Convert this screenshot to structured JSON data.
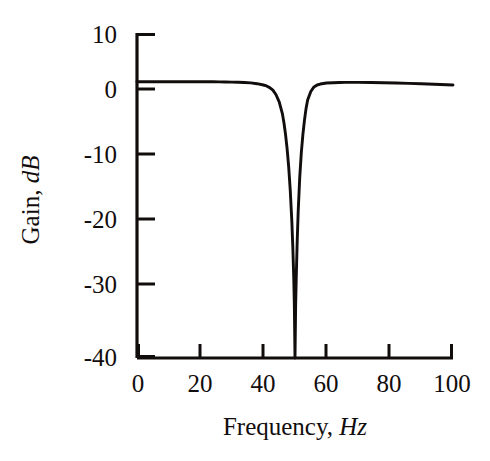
{
  "chart_data": {
    "type": "line",
    "title": "",
    "xlabel": "Frequency,",
    "xlabel_unit": "Hz",
    "ylabel": "Gain,",
    "ylabel_unit": "dB",
    "xlim": [
      0,
      100
    ],
    "ylim": [
      -40,
      10
    ],
    "xticks": [
      0,
      20,
      40,
      60,
      80,
      100
    ],
    "xtick_labels": [
      "0",
      "20",
      "40",
      "60",
      "80",
      "100"
    ],
    "yticks": [
      10,
      0,
      -10,
      -20,
      -30,
      -40
    ],
    "ytick_labels": [
      "10",
      "0",
      "-10",
      "-20",
      "-30",
      "-40"
    ],
    "grid": false,
    "legend": "none",
    "tick_direction": "in",
    "axes_style": "left-bottom-spines",
    "series": [
      {
        "name": "Notch filter gain response",
        "notch_center_hz": 50,
        "notch_depth_db": -40,
        "passband_gain_db": 2.5,
        "x": [
          0,
          2,
          4,
          6,
          8,
          10,
          12,
          14,
          16,
          18,
          20,
          22,
          24,
          26,
          28,
          30,
          32,
          34,
          36,
          38,
          40,
          41,
          42,
          43,
          44,
          45,
          46,
          46.5,
          47,
          47.5,
          48,
          48.5,
          49,
          49.3,
          49.6,
          49.8,
          50,
          50.2,
          50.4,
          50.7,
          51,
          51.5,
          52,
          52.5,
          53,
          53.5,
          54,
          55,
          56,
          57,
          58,
          60,
          62,
          64,
          66,
          68,
          70,
          74,
          78,
          82,
          86,
          90,
          94,
          98,
          100
        ],
        "y": [
          2.5,
          2.5,
          2.5,
          2.5,
          2.5,
          2.5,
          2.5,
          2.5,
          2.5,
          2.5,
          2.5,
          2.5,
          2.5,
          2.48,
          2.46,
          2.44,
          2.42,
          2.38,
          2.32,
          2.2,
          2.0,
          1.85,
          1.6,
          1.2,
          0.5,
          -0.6,
          -2.4,
          -3.8,
          -5.6,
          -7.8,
          -10.6,
          -14.2,
          -19.0,
          -22.8,
          -27.6,
          -32.0,
          -40.0,
          -32.0,
          -27.6,
          -22.0,
          -17.6,
          -12.2,
          -8.4,
          -5.6,
          -3.4,
          -1.6,
          -0.3,
          1.0,
          1.7,
          2.0,
          2.15,
          2.3,
          2.35,
          2.38,
          2.4,
          2.4,
          2.4,
          2.38,
          2.35,
          2.3,
          2.25,
          2.2,
          2.12,
          2.05,
          2.0
        ]
      }
    ]
  },
  "axes_geometry": {
    "left_px": 137,
    "right_px": 453,
    "top_px": 33,
    "bottom_px": 358
  }
}
